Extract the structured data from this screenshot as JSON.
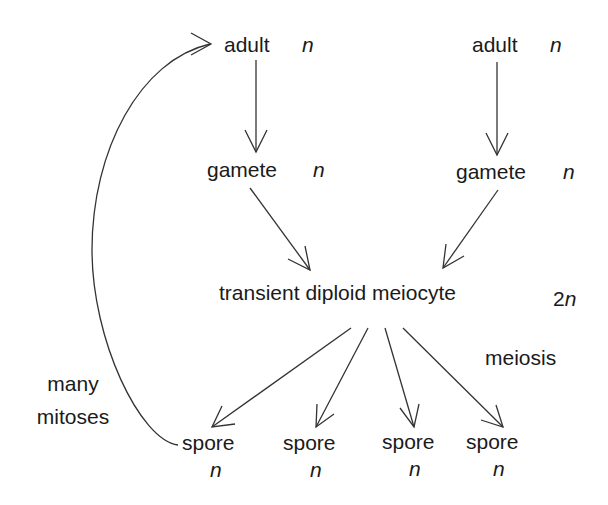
{
  "diagram": {
    "type": "life-cycle",
    "nodes": {
      "adult_left": {
        "label": "adult",
        "ploidy": "n"
      },
      "adult_right": {
        "label": "adult",
        "ploidy": "n"
      },
      "gamete_left": {
        "label": "gamete",
        "ploidy": "n"
      },
      "gamete_right": {
        "label": "gamete",
        "ploidy": "n"
      },
      "meiocyte": {
        "label": "transient diploid meiocyte",
        "ploidy": "2n",
        "ploidy_num": "2",
        "ploidy_var": "n"
      },
      "spores": [
        {
          "label": "spore",
          "ploidy": "n"
        },
        {
          "label": "spore",
          "ploidy": "n"
        },
        {
          "label": "spore",
          "ploidy": "n"
        },
        {
          "label": "spore",
          "ploidy": "n"
        }
      ]
    },
    "process_labels": {
      "meiosis": "meiosis",
      "mitoses_line1": "many",
      "mitoses_line2": "mitoses"
    },
    "edges": [
      {
        "from": "adult_left",
        "to": "gamete_left"
      },
      {
        "from": "adult_right",
        "to": "gamete_right"
      },
      {
        "from": "gamete_left",
        "to": "meiocyte"
      },
      {
        "from": "gamete_right",
        "to": "meiocyte"
      },
      {
        "from": "meiocyte",
        "to": "spore_1",
        "label": "meiosis"
      },
      {
        "from": "meiocyte",
        "to": "spore_2"
      },
      {
        "from": "meiocyte",
        "to": "spore_3"
      },
      {
        "from": "meiocyte",
        "to": "spore_4"
      },
      {
        "from": "spore_1",
        "to": "adult_left",
        "label": "many mitoses",
        "curved": true
      }
    ],
    "colors": {
      "ink": "#1a1a1a",
      "line": "#333333",
      "background": "#ffffff"
    }
  }
}
